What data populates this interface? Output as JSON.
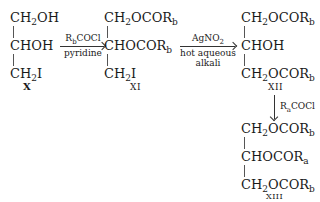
{
  "compounds": {
    "X": {
      "label": "X",
      "lines": [
        "CH",
        "OH",
        "CHOH",
        "CH",
        "I"
      ]
    },
    "XI": {
      "label": "XI",
      "lines": [
        "CH",
        "OCOR",
        "b",
        "CHOCOR",
        "b",
        "CH",
        "I"
      ]
    },
    "XII": {
      "label": "XII",
      "lines": [
        "CH",
        "OCOR",
        "b",
        "CHOH",
        "CH",
        "OCOR",
        "b"
      ]
    },
    "XIII": {
      "label": "XIII",
      "lines": [
        "CH",
        "OCOR",
        "b",
        "CHOCOR",
        "a",
        "CH",
        "OCOR",
        "b"
      ]
    }
  },
  "reagents": {
    "step1": {
      "above": "R",
      "above_sub": "b",
      "above_rest": "COCl",
      "below": "pyridine"
    },
    "step2": {
      "above": "AgNO",
      "above_sub": "2",
      "below1": "hot aqueous",
      "below2": "alkali"
    },
    "step3": {
      "text": "R",
      "text_sub": "a",
      "text_rest": "COCl"
    }
  },
  "subs": {
    "two": "2"
  }
}
